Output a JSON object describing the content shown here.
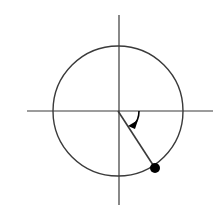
{
  "diagram": {
    "type": "unit-circle-angle",
    "colors": {
      "stroke": "#3a3a3a",
      "point": "#000000",
      "background": "#ffffff"
    },
    "center": [
      118,
      111
    ],
    "radius": 65,
    "axes": {
      "horizontal": {
        "x1": 27,
        "x2": 213,
        "y": 111
      },
      "vertical": {
        "x": 119,
        "y1": 15,
        "y2": 205
      }
    },
    "radius_line": {
      "from": [
        118,
        111
      ],
      "to": [
        155,
        168
      ]
    },
    "point": {
      "cx": 155,
      "cy": 168,
      "r": 5
    },
    "angle_arrow": {
      "direction": "clockwise",
      "label": ""
    }
  }
}
